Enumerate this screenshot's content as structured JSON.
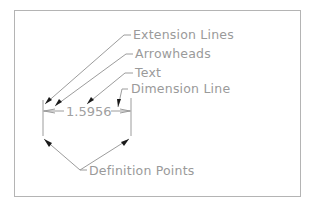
{
  "diagram": {
    "dimension_value": "1.5956",
    "labels": {
      "extension_lines": "Extension Lines",
      "arrowheads": "Arrowheads",
      "text": "Text",
      "dimension_line": "Dimension Line",
      "definition_points": "Definition Points"
    },
    "colors": {
      "line": "#9c9c9c",
      "arrow": "#1a1a1a",
      "border": "#b4b4b4",
      "text": "#9a9a9a"
    }
  }
}
